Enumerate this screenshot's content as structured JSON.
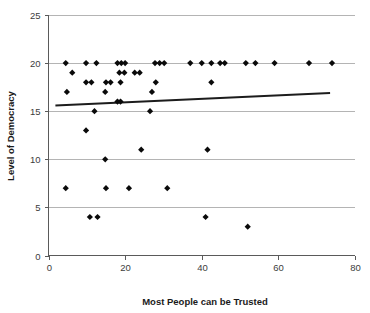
{
  "chart_data": {
    "type": "scatter",
    "title": "",
    "xlabel": "Most People can be Trusted",
    "ylabel": "Level of Democracy",
    "xlim": [
      0,
      80
    ],
    "ylim": [
      0,
      25
    ],
    "xticks": [
      0,
      20,
      40,
      60,
      80
    ],
    "yticks": [
      0,
      5,
      10,
      15,
      20,
      25
    ],
    "xtick_labels": [
      "0",
      "20",
      "40",
      "60",
      "80"
    ],
    "ytick_labels": [
      "0",
      "5",
      "10",
      "15",
      "20",
      "25"
    ],
    "grid": "horizontal",
    "legend": "none",
    "marker": "diamond",
    "marker_color": "#0a0a0a",
    "trendline": {
      "type": "linear",
      "color": "#1c1c1c",
      "x_start": 1.8,
      "y_start": 15.6,
      "x_end": 73.5,
      "y_end": 16.9
    },
    "points": [
      {
        "x": 4.5,
        "y": 20
      },
      {
        "x": 9.8,
        "y": 20
      },
      {
        "x": 12.5,
        "y": 20
      },
      {
        "x": 18.0,
        "y": 20
      },
      {
        "x": 19.0,
        "y": 20
      },
      {
        "x": 20.0,
        "y": 20
      },
      {
        "x": 27.8,
        "y": 20
      },
      {
        "x": 29.0,
        "y": 20
      },
      {
        "x": 30.2,
        "y": 20
      },
      {
        "x": 37.0,
        "y": 20
      },
      {
        "x": 40.0,
        "y": 20
      },
      {
        "x": 42.5,
        "y": 20
      },
      {
        "x": 44.8,
        "y": 20
      },
      {
        "x": 46.0,
        "y": 20
      },
      {
        "x": 51.5,
        "y": 20
      },
      {
        "x": 54.0,
        "y": 20
      },
      {
        "x": 59.0,
        "y": 20
      },
      {
        "x": 68.0,
        "y": 20
      },
      {
        "x": 74.0,
        "y": 20
      },
      {
        "x": 6.2,
        "y": 19
      },
      {
        "x": 18.5,
        "y": 19
      },
      {
        "x": 19.8,
        "y": 19
      },
      {
        "x": 22.5,
        "y": 19
      },
      {
        "x": 23.8,
        "y": 19
      },
      {
        "x": 9.8,
        "y": 18
      },
      {
        "x": 11.2,
        "y": 18
      },
      {
        "x": 15.0,
        "y": 18
      },
      {
        "x": 16.2,
        "y": 18
      },
      {
        "x": 18.8,
        "y": 18
      },
      {
        "x": 28.0,
        "y": 18
      },
      {
        "x": 42.5,
        "y": 18
      },
      {
        "x": 4.8,
        "y": 17
      },
      {
        "x": 14.8,
        "y": 17
      },
      {
        "x": 27.0,
        "y": 17
      },
      {
        "x": 18.0,
        "y": 16
      },
      {
        "x": 18.8,
        "y": 16
      },
      {
        "x": 12.0,
        "y": 15
      },
      {
        "x": 26.5,
        "y": 15
      },
      {
        "x": 9.8,
        "y": 13
      },
      {
        "x": 24.2,
        "y": 11
      },
      {
        "x": 41.5,
        "y": 11
      },
      {
        "x": 14.8,
        "y": 10
      },
      {
        "x": 4.5,
        "y": 7
      },
      {
        "x": 15.0,
        "y": 7
      },
      {
        "x": 21.0,
        "y": 7
      },
      {
        "x": 31.0,
        "y": 7
      },
      {
        "x": 10.8,
        "y": 4
      },
      {
        "x": 12.8,
        "y": 4
      },
      {
        "x": 41.0,
        "y": 4
      },
      {
        "x": 52.0,
        "y": 3
      }
    ]
  },
  "axes": {
    "x_axis_name": "x-axis",
    "y_axis_name": "y-axis"
  }
}
